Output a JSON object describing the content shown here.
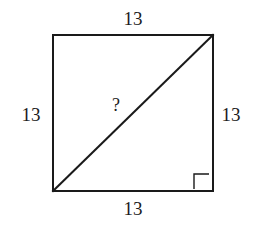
{
  "figure": {
    "type": "geometry-diagram",
    "shape": "square",
    "background_color": "#ffffff",
    "stroke_color": "#1a1a1a",
    "text_color": "#1c1c1c",
    "stroke_width": 2,
    "square": {
      "top_left": [
        53,
        35
      ],
      "top_right": [
        213,
        35
      ],
      "bottom_right": [
        213,
        191
      ],
      "bottom_left": [
        53,
        191
      ],
      "width": 160,
      "height": 156
    },
    "diagonal": {
      "from": [
        53,
        191
      ],
      "to": [
        213,
        35
      ],
      "stroke_width": 2
    },
    "right_angle_marker": {
      "present": true,
      "at_vertex": "bottom-right",
      "size": 15,
      "x": 194,
      "y": 173
    }
  },
  "labels": {
    "top": "13",
    "right": "13",
    "bottom": "13",
    "left": "13",
    "diagonal": "?"
  }
}
